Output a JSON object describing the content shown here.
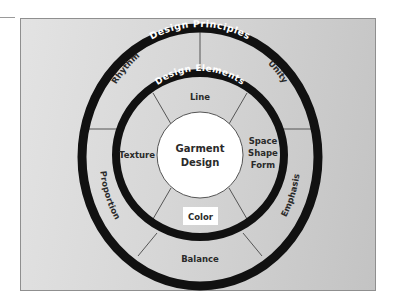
{
  "diagram": {
    "center": {
      "line1": "Garment",
      "line2": "Design"
    },
    "inner_ring": {
      "title": "Design Elements",
      "segments": [
        {
          "id": "line",
          "label": "Line"
        },
        {
          "id": "space-shape-form",
          "lines": [
            "Space",
            "Shape",
            "Form"
          ]
        },
        {
          "id": "color",
          "label": "Color"
        },
        {
          "id": "texture",
          "label": "Texture"
        }
      ]
    },
    "outer_ring": {
      "title": "Design Principles",
      "segments": [
        {
          "id": "rhythm",
          "label": "Rhythm"
        },
        {
          "id": "unity",
          "label": "Unity"
        },
        {
          "id": "emphasis",
          "label": "Emphasis"
        },
        {
          "id": "balance",
          "label": "Balance"
        },
        {
          "id": "proportion",
          "label": "Proportion"
        }
      ]
    },
    "colors": {
      "ring": "#111111",
      "panel_light": "#e3e3e3",
      "panel_dark": "#c3c3c3",
      "center_fill": "#ffffff",
      "text": "#2a2a2a",
      "spoke": "#555555"
    }
  }
}
